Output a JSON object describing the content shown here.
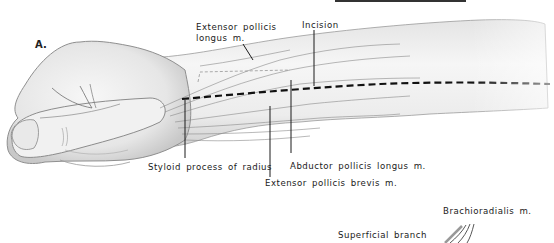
{
  "figure": {
    "panel_letter": "A.",
    "labels": {
      "extensor_pollicis_longus_line1": "Extensor pollicis",
      "extensor_pollicis_longus_line2": "longus m.",
      "incision": "Incision",
      "styloid_process": "Styloid process of radius",
      "abductor_pollicis_longus": "Abductor pollicis longus m.",
      "extensor_pollicis_brevis": "Extensor pollicis brevis m.",
      "brachioradialis": "Brachioradialis m.",
      "superficial_branch": "Superficial branch"
    },
    "colors": {
      "ink": "#1a1a1a",
      "skin_shade": "#d9d9d9",
      "skin_light": "#f2f2f2",
      "incision_line": "#111111"
    }
  }
}
